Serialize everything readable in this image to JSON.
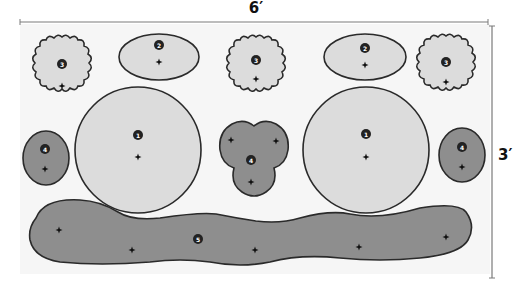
{
  "diagram": {
    "width_label": "6′",
    "height_label": "3′",
    "colors": {
      "board_fill": "#f6f6f6",
      "light_piece": "#dcdcdc",
      "dark_piece": "#8e8e8e",
      "outline": "#2a2a2a",
      "dimension_line": "#7a7a7a",
      "badge": "#222222"
    },
    "pieces": [
      {
        "id": "1",
        "shape": "large-circle",
        "count": 2,
        "tone": "light"
      },
      {
        "id": "2",
        "shape": "oval",
        "count": 2,
        "tone": "light"
      },
      {
        "id": "3",
        "shape": "scalloped-circle",
        "count": 3,
        "tone": "light"
      },
      {
        "id": "4",
        "shape": "small-oval / trefoil",
        "count": 3,
        "tone": "dark"
      },
      {
        "id": "5",
        "shape": "wavy-band",
        "count": 1,
        "tone": "dark"
      }
    ],
    "badges": {
      "b1a": "1",
      "b1b": "1",
      "b2a": "2",
      "b2b": "2",
      "b3a": "3",
      "b3b": "3",
      "b3c": "3",
      "b4a": "4",
      "b4b": "4",
      "b4c": "4",
      "b5": "5"
    }
  }
}
